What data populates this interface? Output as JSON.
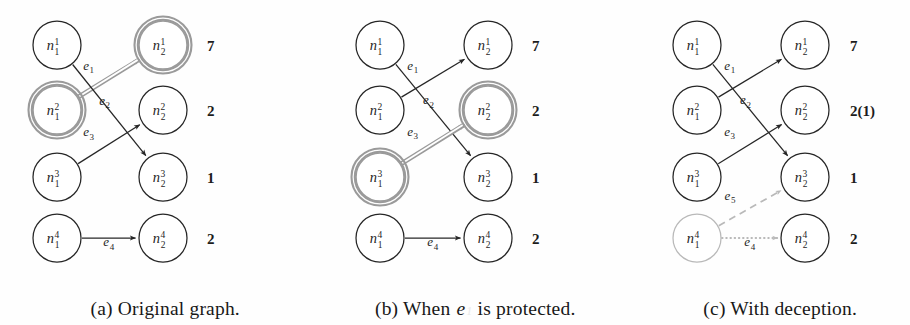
{
  "figure": {
    "type": "bipartite-graph-diagram",
    "panel_count": 3,
    "colors": {
      "ink": "#262626",
      "highlight": "#9a9a9a",
      "faded": "#b9b9b9",
      "paper": "#fefefe"
    }
  },
  "panels": [
    {
      "id": "a",
      "caption_prefix": "(a)",
      "caption_text": "Original graph.",
      "left_nodes": [
        {
          "base": "n",
          "sub": "1",
          "sup": "1",
          "highlighted": false,
          "faded": false
        },
        {
          "base": "n",
          "sub": "1",
          "sup": "2",
          "highlighted": true,
          "faded": false
        },
        {
          "base": "n",
          "sub": "1",
          "sup": "3",
          "highlighted": false,
          "faded": false
        },
        {
          "base": "n",
          "sub": "1",
          "sup": "4",
          "highlighted": false,
          "faded": false
        }
      ],
      "right_nodes": [
        {
          "base": "n",
          "sub": "2",
          "sup": "1",
          "highlighted": true,
          "faded": false
        },
        {
          "base": "n",
          "sub": "2",
          "sup": "2",
          "highlighted": false,
          "faded": false
        },
        {
          "base": "n",
          "sub": "2",
          "sup": "3",
          "highlighted": false,
          "faded": false
        },
        {
          "base": "n",
          "sub": "2",
          "sup": "4",
          "highlighted": false,
          "faded": false
        }
      ],
      "weights": [
        {
          "value": "7",
          "extra": ""
        },
        {
          "value": "2",
          "extra": ""
        },
        {
          "value": "1",
          "extra": ""
        },
        {
          "value": "2",
          "extra": ""
        }
      ],
      "edges": [
        {
          "base": "e",
          "sub": "1",
          "from_row": 2,
          "to_row": 1,
          "style": "highlight",
          "label_dx": 0,
          "label_dy": 0
        },
        {
          "base": "e",
          "sub": "2",
          "from_row": 1,
          "to_row": 3,
          "style": "solid",
          "label_dx": 0,
          "label_dy": 0
        },
        {
          "base": "e",
          "sub": "3",
          "from_row": 3,
          "to_row": 2,
          "style": "solid",
          "label_dx": 0,
          "label_dy": 0
        },
        {
          "base": "e",
          "sub": "4",
          "from_row": 4,
          "to_row": 4,
          "style": "solid",
          "label_dx": 0,
          "label_dy": 0
        }
      ]
    },
    {
      "id": "b",
      "caption_prefix": "(b)",
      "caption_text_before": "When ",
      "caption_italic": "e",
      "caption_italic_sub": "1",
      "caption_text_after": " is protected.",
      "left_nodes": [
        {
          "base": "n",
          "sub": "1",
          "sup": "1",
          "highlighted": false,
          "faded": false
        },
        {
          "base": "n",
          "sub": "1",
          "sup": "2",
          "highlighted": false,
          "faded": false
        },
        {
          "base": "n",
          "sub": "1",
          "sup": "3",
          "highlighted": true,
          "faded": false
        },
        {
          "base": "n",
          "sub": "1",
          "sup": "4",
          "highlighted": false,
          "faded": false
        }
      ],
      "right_nodes": [
        {
          "base": "n",
          "sub": "2",
          "sup": "1",
          "highlighted": false,
          "faded": false
        },
        {
          "base": "n",
          "sub": "2",
          "sup": "2",
          "highlighted": true,
          "faded": false
        },
        {
          "base": "n",
          "sub": "2",
          "sup": "3",
          "highlighted": false,
          "faded": false
        },
        {
          "base": "n",
          "sub": "2",
          "sup": "4",
          "highlighted": false,
          "faded": false
        }
      ],
      "weights": [
        {
          "value": "7",
          "extra": ""
        },
        {
          "value": "2",
          "extra": ""
        },
        {
          "value": "1",
          "extra": ""
        },
        {
          "value": "2",
          "extra": ""
        }
      ],
      "edges": [
        {
          "base": "e",
          "sub": "1",
          "from_row": 2,
          "to_row": 1,
          "style": "solid",
          "label_dx": 0,
          "label_dy": 0
        },
        {
          "base": "e",
          "sub": "2",
          "from_row": 1,
          "to_row": 3,
          "style": "solid",
          "label_dx": 0,
          "label_dy": 0
        },
        {
          "base": "e",
          "sub": "3",
          "from_row": 3,
          "to_row": 2,
          "style": "highlight",
          "label_dx": 0,
          "label_dy": 0
        },
        {
          "base": "e",
          "sub": "4",
          "from_row": 4,
          "to_row": 4,
          "style": "solid",
          "label_dx": 0,
          "label_dy": 0
        }
      ]
    },
    {
      "id": "c",
      "caption_prefix": "(c)",
      "caption_text": "With deception.",
      "left_nodes": [
        {
          "base": "n",
          "sub": "1",
          "sup": "1",
          "highlighted": false,
          "faded": false
        },
        {
          "base": "n",
          "sub": "1",
          "sup": "2",
          "highlighted": false,
          "faded": false
        },
        {
          "base": "n",
          "sub": "1",
          "sup": "3",
          "highlighted": false,
          "faded": false
        },
        {
          "base": "n",
          "sub": "1",
          "sup": "4",
          "highlighted": false,
          "faded": true
        }
      ],
      "right_nodes": [
        {
          "base": "n",
          "sub": "2",
          "sup": "1",
          "highlighted": false,
          "faded": false
        },
        {
          "base": "n",
          "sub": "2",
          "sup": "2",
          "highlighted": false,
          "faded": false
        },
        {
          "base": "n",
          "sub": "2",
          "sup": "3",
          "highlighted": false,
          "faded": false
        },
        {
          "base": "n",
          "sub": "2",
          "sup": "4",
          "highlighted": false,
          "faded": false
        }
      ],
      "weights": [
        {
          "value": "7",
          "extra": ""
        },
        {
          "value": "2",
          "extra": "(1)"
        },
        {
          "value": "1",
          "extra": ""
        },
        {
          "value": "2",
          "extra": ""
        }
      ],
      "edges": [
        {
          "base": "e",
          "sub": "1",
          "from_row": 2,
          "to_row": 1,
          "style": "solid",
          "label_dx": 0,
          "label_dy": 0
        },
        {
          "base": "e",
          "sub": "2",
          "from_row": 1,
          "to_row": 3,
          "style": "solid",
          "label_dx": 0,
          "label_dy": 0
        },
        {
          "base": "e",
          "sub": "3",
          "from_row": 3,
          "to_row": 2,
          "style": "solid",
          "label_dx": 0,
          "label_dy": 0
        },
        {
          "base": "e",
          "sub": "5",
          "from_row": 4,
          "to_row": 3,
          "style": "dashed",
          "label_dx": 0,
          "label_dy": 0
        },
        {
          "base": "e",
          "sub": "4",
          "from_row": 4,
          "to_row": 4,
          "style": "dotted",
          "label_dx": 0,
          "label_dy": 0
        }
      ]
    }
  ],
  "geometry": {
    "row_y": [
      45,
      110,
      177,
      238
    ],
    "node_radius": 24,
    "panel_left_x": [
      57,
      380,
      697
    ],
    "panel_right_x": [
      163,
      488,
      805
    ],
    "panel_weight_x": [
      207,
      532,
      850
    ],
    "panel_origin_x": [
      0,
      300,
      620
    ]
  }
}
